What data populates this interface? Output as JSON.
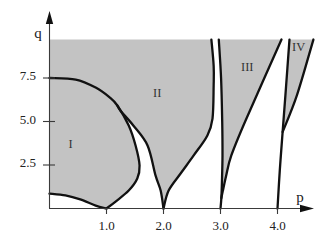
{
  "chart_data": {
    "type": "area",
    "title": "",
    "xlabel": "p",
    "ylabel": "q",
    "xlim": [
      0,
      4.63
    ],
    "ylim": [
      0,
      11.1
    ],
    "shaded_q_max": 9.71,
    "grid": false,
    "legend": null,
    "x_ticks": [
      {
        "value": 1.0,
        "label": "1.0"
      },
      {
        "value": 2.0,
        "label": "2.0"
      },
      {
        "value": 3.0,
        "label": "3.0"
      },
      {
        "value": 4.0,
        "label": "4.0"
      }
    ],
    "y_ticks": [
      {
        "value": 2.5,
        "label": "2.5"
      },
      {
        "value": 5.0,
        "label": "5.0"
      },
      {
        "value": 7.5,
        "label": "7.5"
      }
    ],
    "curves": {
      "A": [
        [
          0,
          7.5
        ],
        [
          0.46,
          7.41
        ],
        [
          0.81,
          6.95
        ],
        [
          1.05,
          6.4
        ],
        [
          1.19,
          5.92
        ],
        [
          1.39,
          4.77
        ],
        [
          1.51,
          3.62
        ],
        [
          1.58,
          2.47
        ],
        [
          1.54,
          1.72
        ],
        [
          1.39,
          1.03
        ],
        [
          1.16,
          0.4
        ],
        [
          1.0,
          0
        ]
      ],
      "B": [
        [
          1.19,
          5.92
        ],
        [
          1.25,
          5.6
        ],
        [
          1.47,
          4.77
        ],
        [
          1.72,
          3.62
        ],
        [
          1.86,
          1.9
        ],
        [
          1.95,
          1.03
        ],
        [
          2.0,
          0
        ]
      ],
      "C": [
        [
          2.84,
          9.71
        ],
        [
          2.88,
          8.2
        ],
        [
          2.88,
          7.07
        ],
        [
          2.86,
          5.17
        ],
        [
          2.77,
          4.2
        ],
        [
          2.53,
          3.05
        ],
        [
          2.3,
          2.01
        ],
        [
          2.09,
          1.03
        ],
        [
          2.0,
          0
        ]
      ],
      "I_bottom": [
        [
          0,
          0.86
        ],
        [
          0.28,
          0.75
        ],
        [
          0.54,
          0.52
        ],
        [
          0.81,
          0.17
        ],
        [
          1.0,
          0
        ]
      ],
      "III_left": [
        [
          2.97,
          9.71
        ],
        [
          3.01,
          7.5
        ],
        [
          3.03,
          5.0
        ],
        [
          3.035,
          3.05
        ],
        [
          3.025,
          1.5
        ],
        [
          3.015,
          0.6
        ],
        [
          3.0,
          0
        ]
      ],
      "III_right": [
        [
          4.07,
          9.71
        ],
        [
          3.44,
          5.06
        ],
        [
          3.19,
          3.05
        ],
        [
          3.1,
          1.9
        ],
        [
          3.04,
          1.0
        ],
        [
          3.015,
          0.6
        ]
      ],
      "IV_left": [
        [
          4.21,
          9.71
        ],
        [
          4.15,
          7.0
        ],
        [
          4.09,
          4.4
        ],
        [
          4.04,
          2.18
        ],
        [
          4.0,
          0
        ]
      ],
      "IV_right": [
        [
          4.63,
          9.71
        ],
        [
          4.34,
          6.5
        ],
        [
          4.09,
          4.4
        ]
      ]
    },
    "strokes": [
      "A",
      "B",
      "C",
      "I_bottom",
      "III_left",
      "III_right",
      "IV_left",
      "IV_right"
    ],
    "regions": [
      {
        "name": "region-I-II",
        "start": [
          0,
          9.71
        ],
        "segments": [
          {
            "curve": "C"
          },
          {
            "curve": "B",
            "reverse": true
          },
          {
            "curve": "A",
            "from": 4
          },
          {
            "curve": "I_bottom",
            "reverse": true
          }
        ]
      },
      {
        "name": "region-III",
        "segments": [
          {
            "curve": "III_left",
            "to": 5
          },
          {
            "curve": "III_right",
            "reverse": true
          }
        ]
      },
      {
        "name": "region-IV",
        "segments": [
          {
            "curve": "IV_left",
            "to": 2
          },
          {
            "curve": "IV_right",
            "reverse": true
          }
        ]
      }
    ],
    "annotations": [
      {
        "text": "I",
        "p": 0.37,
        "q": 3.74
      },
      {
        "text": "II",
        "p": 1.89,
        "q": 6.67
      },
      {
        "text": "III",
        "p": 3.47,
        "q": 8.16
      },
      {
        "text": "IV",
        "p": 4.37,
        "q": 9.31
      }
    ]
  },
  "colors": {
    "shade": "#c3c3c3",
    "curve": "#111111",
    "axis": "#3a3a3a"
  }
}
